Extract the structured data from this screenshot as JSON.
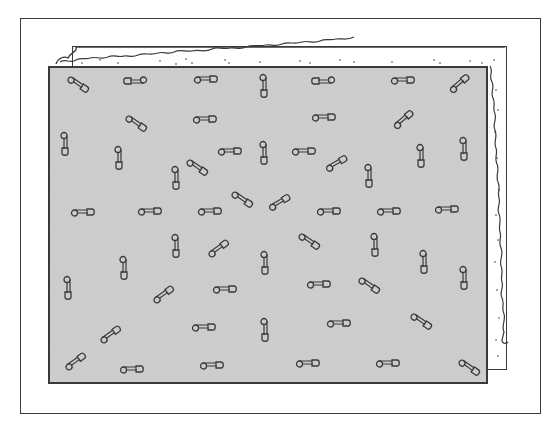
{
  "illustration": {
    "subject": "safety pins scattered on a gray felt/fabric panel over a frayed-edge backing sheet, inside a rectangular frame",
    "colors": {
      "background": "#ffffff",
      "panel": "#c9c9c9",
      "ink": "#3a3a3a"
    },
    "pins": [
      {
        "x": 78,
        "y": 85,
        "rot": 35
      },
      {
        "x": 135,
        "y": 80,
        "rot": 180
      },
      {
        "x": 206,
        "y": 80,
        "rot": 0
      },
      {
        "x": 263,
        "y": 86,
        "rot": 90
      },
      {
        "x": 323,
        "y": 80,
        "rot": 180
      },
      {
        "x": 403,
        "y": 81,
        "rot": 0
      },
      {
        "x": 460,
        "y": 84,
        "rot": -40
      },
      {
        "x": 136,
        "y": 124,
        "rot": 35
      },
      {
        "x": 205,
        "y": 120,
        "rot": 0
      },
      {
        "x": 324,
        "y": 118,
        "rot": 0
      },
      {
        "x": 404,
        "y": 120,
        "rot": -40
      },
      {
        "x": 64,
        "y": 144,
        "rot": 90
      },
      {
        "x": 118,
        "y": 158,
        "rot": 90
      },
      {
        "x": 230,
        "y": 152,
        "rot": 0
      },
      {
        "x": 263,
        "y": 153,
        "rot": 90
      },
      {
        "x": 304,
        "y": 152,
        "rot": 0
      },
      {
        "x": 337,
        "y": 164,
        "rot": -30
      },
      {
        "x": 420,
        "y": 156,
        "rot": 90
      },
      {
        "x": 463,
        "y": 149,
        "rot": 90
      },
      {
        "x": 175,
        "y": 178,
        "rot": 90
      },
      {
        "x": 197,
        "y": 168,
        "rot": 35
      },
      {
        "x": 368,
        "y": 176,
        "rot": 90
      },
      {
        "x": 83,
        "y": 213,
        "rot": 0
      },
      {
        "x": 150,
        "y": 212,
        "rot": 0
      },
      {
        "x": 210,
        "y": 212,
        "rot": 0
      },
      {
        "x": 242,
        "y": 200,
        "rot": 35
      },
      {
        "x": 280,
        "y": 203,
        "rot": -30
      },
      {
        "x": 329,
        "y": 212,
        "rot": 0
      },
      {
        "x": 389,
        "y": 212,
        "rot": 0
      },
      {
        "x": 447,
        "y": 210,
        "rot": 0
      },
      {
        "x": 175,
        "y": 246,
        "rot": 90
      },
      {
        "x": 219,
        "y": 249,
        "rot": -35
      },
      {
        "x": 309,
        "y": 242,
        "rot": 35
      },
      {
        "x": 374,
        "y": 245,
        "rot": 90
      },
      {
        "x": 123,
        "y": 268,
        "rot": 90
      },
      {
        "x": 264,
        "y": 263,
        "rot": 90
      },
      {
        "x": 423,
        "y": 262,
        "rot": 90
      },
      {
        "x": 463,
        "y": 278,
        "rot": 90
      },
      {
        "x": 67,
        "y": 288,
        "rot": 90
      },
      {
        "x": 164,
        "y": 295,
        "rot": -35
      },
      {
        "x": 225,
        "y": 290,
        "rot": 0
      },
      {
        "x": 319,
        "y": 285,
        "rot": 0
      },
      {
        "x": 369,
        "y": 286,
        "rot": 35
      },
      {
        "x": 111,
        "y": 335,
        "rot": -35
      },
      {
        "x": 204,
        "y": 328,
        "rot": 0
      },
      {
        "x": 264,
        "y": 330,
        "rot": 90
      },
      {
        "x": 339,
        "y": 324,
        "rot": 0
      },
      {
        "x": 421,
        "y": 322,
        "rot": 35
      },
      {
        "x": 76,
        "y": 362,
        "rot": -35
      },
      {
        "x": 132,
        "y": 370,
        "rot": 0
      },
      {
        "x": 212,
        "y": 366,
        "rot": 0
      },
      {
        "x": 308,
        "y": 364,
        "rot": 0
      },
      {
        "x": 388,
        "y": 364,
        "rot": 0
      },
      {
        "x": 469,
        "y": 368,
        "rot": 35
      }
    ]
  }
}
